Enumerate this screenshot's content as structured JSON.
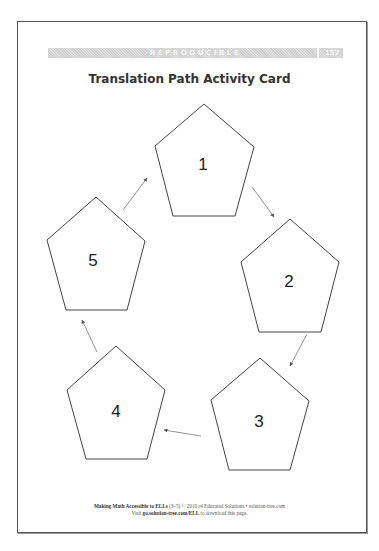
{
  "header": {
    "label": "REPRODUCIBLE",
    "page_number": "157"
  },
  "title": "Translation Path Activity Card",
  "diagram": {
    "shapes": [
      {
        "label": "1",
        "points": "204,104 254,147 235,216 173,216 155,146",
        "text_x": 203,
        "text_y": 170
      },
      {
        "label": "2",
        "points": "290,219 339,262 321,332 259,332 241,262",
        "text_x": 289,
        "text_y": 287
      },
      {
        "label": "3",
        "points": "260,358 309,401 290,470 229,470 211,400",
        "text_x": 259,
        "text_y": 427
      },
      {
        "label": "4",
        "points": "116,346 165,390 147,459 86,459 67,390",
        "text_x": 116,
        "text_y": 417
      },
      {
        "label": "5",
        "points": "96,197 145,241 127,310 66,310 47,240",
        "text_x": 93,
        "text_y": 266
      }
    ],
    "arrows": [
      {
        "from": "1",
        "to": "2",
        "x1": 252,
        "y1": 187,
        "x2": 274,
        "y2": 217
      },
      {
        "from": "2",
        "to": "3",
        "x1": 307,
        "y1": 334,
        "x2": 290,
        "y2": 366
      },
      {
        "from": "3",
        "to": "4",
        "x1": 201,
        "y1": 436,
        "x2": 164,
        "y2": 430
      },
      {
        "from": "4",
        "to": "5",
        "x1": 97,
        "y1": 352,
        "x2": 82,
        "y2": 320
      },
      {
        "from": "5",
        "to": "1",
        "x1": 123,
        "y1": 210,
        "x2": 147,
        "y2": 178
      }
    ],
    "stroke_color": "#444444",
    "arrow_color": "#777777"
  },
  "footer": {
    "line1_bold": "Making Math Accessible to ELLs",
    "line1_rest": " (3–5) © 2010 r4 Educated Solutions • solution-tree.com",
    "line2_pre": "Visit ",
    "line2_bold": "go.solution-tree.com/ELL",
    "line2_post": " to download this page."
  }
}
